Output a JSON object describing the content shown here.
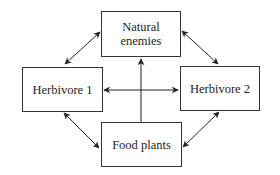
{
  "diagram": {
    "type": "interaction-web",
    "nodes": [
      {
        "id": "natural_enemies",
        "label": "Natural\nenemies"
      },
      {
        "id": "herbivore_1",
        "label": "Herbivore 1"
      },
      {
        "id": "herbivore_2",
        "label": "Herbivore 2"
      },
      {
        "id": "food_plants",
        "label": "Food plants"
      }
    ],
    "edges": [
      {
        "from": "herbivore_1",
        "to": "natural_enemies",
        "direction": "both"
      },
      {
        "from": "herbivore_2",
        "to": "natural_enemies",
        "direction": "both"
      },
      {
        "from": "herbivore_1",
        "to": "food_plants",
        "direction": "both"
      },
      {
        "from": "herbivore_2",
        "to": "food_plants",
        "direction": "both"
      },
      {
        "from": "herbivore_1",
        "to": "herbivore_2",
        "direction": "both"
      },
      {
        "from": "food_plants",
        "to": "natural_enemies",
        "direction": "forward"
      }
    ],
    "colors": {
      "line": "#222222",
      "box_border": "#333333",
      "background": "#ffffff"
    }
  }
}
